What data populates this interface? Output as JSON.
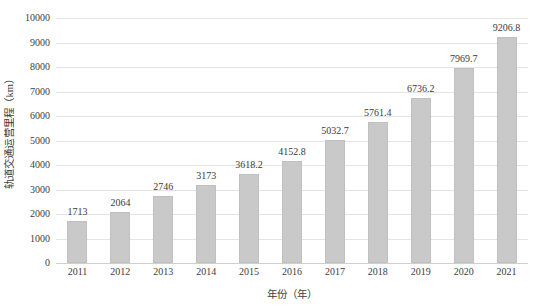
{
  "chart_data": {
    "type": "bar",
    "title": "",
    "subtitle": "",
    "xlabel": "年份（年）",
    "ylabel": "轨道交通运营里程（km）",
    "categories": [
      "2011",
      "2012",
      "2013",
      "2014",
      "2015",
      "2016",
      "2017",
      "2018",
      "2019",
      "2020",
      "2021"
    ],
    "values": [
      1713,
      2064,
      2746,
      3173,
      3618.2,
      4152.8,
      5032.7,
      5761.4,
      6736.2,
      7969.7,
      9206.8
    ],
    "data_labels": [
      "1713",
      "2064",
      "2746",
      "3173",
      "3618.2",
      "4152.8",
      "5032.7",
      "5761.4",
      "6736.2",
      "7969.7",
      "9206.8"
    ],
    "ylim": [
      0,
      10000
    ],
    "ytick_values": [
      0,
      1000,
      2000,
      3000,
      4000,
      5000,
      6000,
      7000,
      8000,
      9000,
      10000
    ],
    "ytick_labels": [
      "0",
      "1000",
      "2000",
      "3000",
      "4000",
      "5000",
      "6000",
      "7000",
      "8000",
      "9000",
      "10000"
    ],
    "grid": "horizontal",
    "legend": "none",
    "series": [
      {
        "name": "轨道交通运营里程",
        "values": [
          1713,
          2064,
          2746,
          3173,
          3618.2,
          4152.8,
          5032.7,
          5761.4,
          6736.2,
          7969.7,
          9206.8
        ]
      }
    ],
    "colors": {
      "bar_fill": "#c9c9c9",
      "bar_stroke": "#c0c0c0",
      "gridline": "#e4e4e4",
      "baseline": "#cfcfcf",
      "text": "#3d3d3d",
      "background": "#ffffff"
    }
  }
}
